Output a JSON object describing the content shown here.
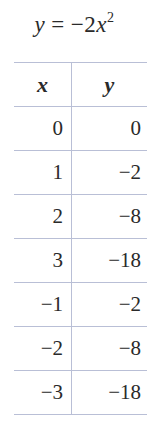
{
  "title": {
    "lhs": "y",
    "equals": "=",
    "rhs_coefficient": "−2",
    "rhs_variable": "x",
    "rhs_exponent": "2"
  },
  "table": {
    "headers": {
      "x": "x",
      "y": "y"
    },
    "rows": [
      {
        "x": "0",
        "y": "0"
      },
      {
        "x": "1",
        "y": "−2"
      },
      {
        "x": "2",
        "y": "−8"
      },
      {
        "x": "3",
        "y": "−18"
      },
      {
        "x": "−1",
        "y": "−2"
      },
      {
        "x": "−2",
        "y": "−8"
      },
      {
        "x": "−3",
        "y": "−18"
      }
    ]
  },
  "colors": {
    "rule": "#b9bfd6",
    "text": "#2a2a2a"
  }
}
